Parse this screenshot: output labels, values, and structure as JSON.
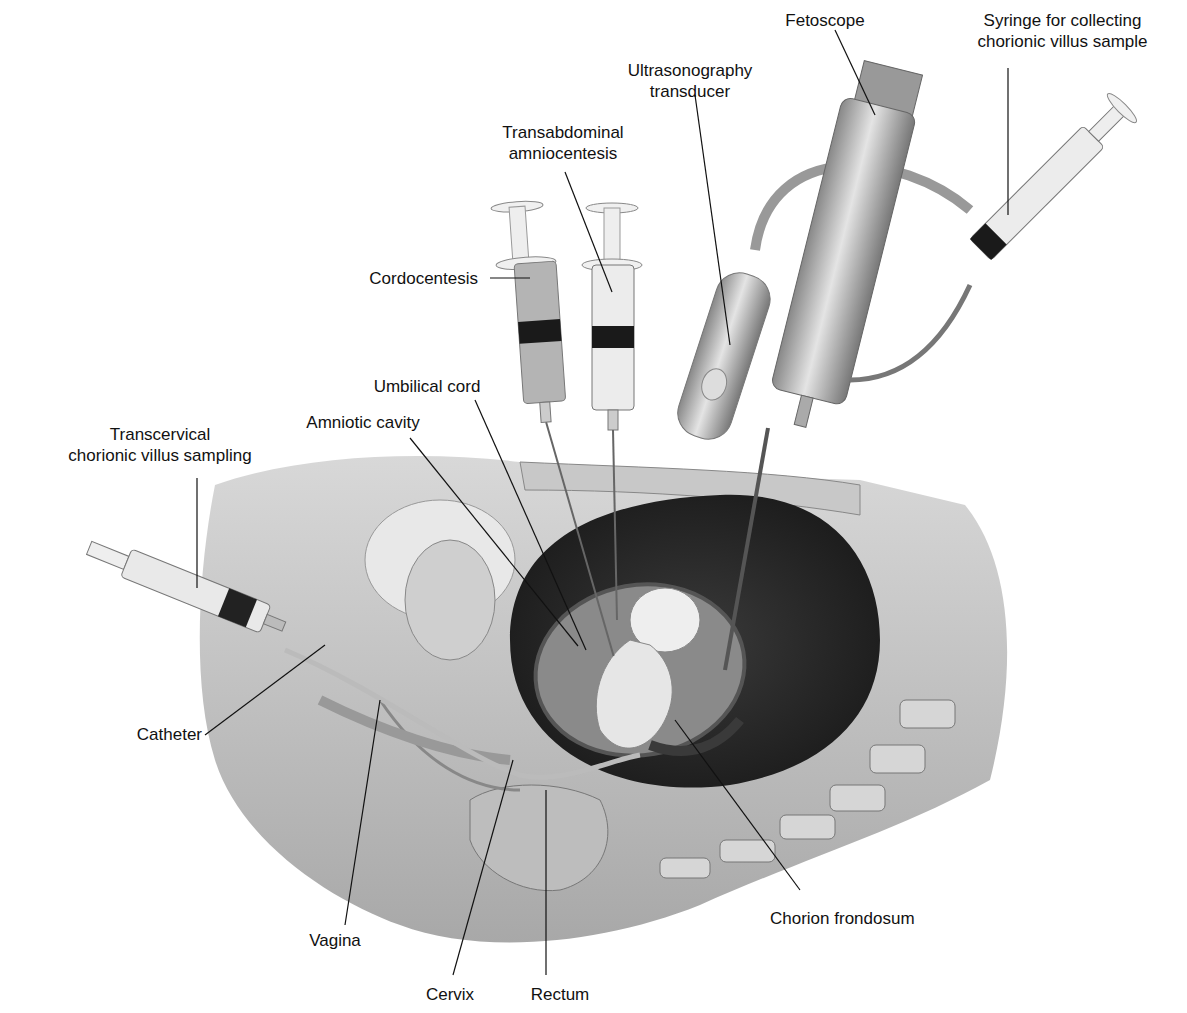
{
  "figure": {
    "labels": {
      "fetoscope": "Fetoscope",
      "syringe_cvs": "Syringe for collecting\nchorionic villus sample",
      "ultrasonography": "Ultrasonography\ntransducer",
      "transabdominal": "Transabdominal\namniocentesis",
      "cordocentesis": "Cordocentesis",
      "umbilical_cord": "Umbilical cord",
      "amniotic_cavity": "Amniotic cavity",
      "transcervical": "Transcervical\nchorionic villus sampling",
      "catheter": "Catheter",
      "vagina": "Vagina",
      "cervix": "Cervix",
      "rectum": "Rectum",
      "chorion_frondosum": "Chorion frondosum"
    }
  }
}
